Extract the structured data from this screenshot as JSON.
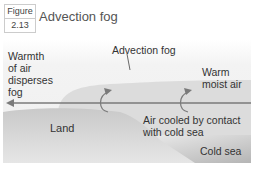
{
  "figure": {
    "label": "Figure",
    "number": "2.13",
    "title": "Advection fog"
  },
  "labels": {
    "warmth": [
      "Warmth",
      "of air",
      "disperses",
      "fog"
    ],
    "advection_fog": "Advection fog",
    "warm_moist_air": [
      "Warm",
      "moist air"
    ],
    "land": "Land",
    "air_cooled": [
      "Air cooled by contact",
      "with cold sea"
    ],
    "cold_sea": "Cold sea"
  },
  "colors": {
    "sky": "#f2f2f2",
    "fog": "#dcdcdc",
    "land": "#cfcfcf",
    "sea": "#bdbdbd",
    "arrow": "#7a7a7a"
  }
}
